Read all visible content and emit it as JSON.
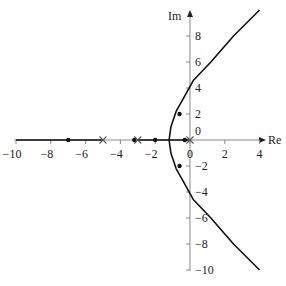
{
  "chart_data": {
    "type": "line",
    "title": "",
    "subtitle": "Root locus",
    "xlabel": "Re",
    "ylabel": "Im",
    "xlim": [
      -10,
      4
    ],
    "ylim": [
      -10,
      10
    ],
    "grid": false,
    "x_ticks": [
      -10,
      -8,
      -6,
      -4,
      -2,
      0,
      2,
      4
    ],
    "x_tick_labels": [
      "−10",
      "−8",
      "−6",
      "−4",
      "−2",
      "0",
      "2",
      "4"
    ],
    "y_ticks": [
      -10,
      -8,
      -6,
      -4,
      -2,
      0,
      2,
      4,
      6,
      8
    ],
    "y_tick_labels": [
      "−10",
      "−8",
      "−6",
      "−4",
      "−2",
      "0",
      "2",
      "4",
      "6",
      "8"
    ],
    "poles": [
      {
        "re": 0,
        "im": 0
      },
      {
        "re": -3.0,
        "im": 0
      },
      {
        "re": -5.0,
        "im": 0
      }
    ],
    "markers": [
      {
        "re": -7.0,
        "im": 0
      },
      {
        "re": -3.2,
        "im": 0
      },
      {
        "re": -2.0,
        "im": 0
      },
      {
        "re": -0.3,
        "im": 0
      },
      {
        "re": -0.6,
        "im": 2.0
      },
      {
        "re": -0.6,
        "im": -2.0
      }
    ],
    "series": [
      {
        "name": "real-axis-branch-left",
        "points": [
          [
            -10,
            0
          ],
          [
            -5,
            0
          ]
        ]
      },
      {
        "name": "real-axis-branch-mid",
        "points": [
          [
            -3,
            0
          ],
          [
            0,
            0
          ]
        ]
      },
      {
        "name": "upper-branch",
        "points": [
          [
            -1.2,
            0
          ],
          [
            -1.1,
            1.0
          ],
          [
            -0.8,
            2.2
          ],
          [
            -0.3,
            3.4
          ],
          [
            0.2,
            4.6
          ],
          [
            1.2,
            6.0
          ],
          [
            2.5,
            8.0
          ],
          [
            4.0,
            10.0
          ]
        ]
      },
      {
        "name": "lower-branch",
        "points": [
          [
            -1.2,
            0
          ],
          [
            -1.1,
            -1.0
          ],
          [
            -0.8,
            -2.2
          ],
          [
            -0.3,
            -3.4
          ],
          [
            0.2,
            -4.6
          ],
          [
            1.2,
            -6.0
          ],
          [
            2.5,
            -8.0
          ],
          [
            4.0,
            -10.0
          ]
        ]
      }
    ]
  }
}
